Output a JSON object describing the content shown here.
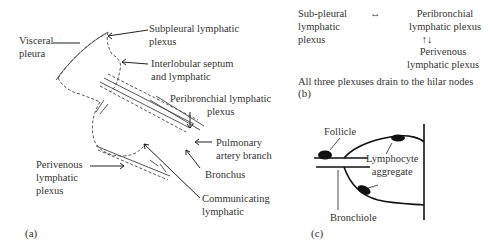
{
  "panel_a": {
    "tag": "(a)",
    "labels": {
      "visceral_pleura": [
        "Visceral",
        "pleura"
      ],
      "subpleural": [
        "Subpleural lymphatic",
        "plexus"
      ],
      "interlobular": [
        "Interlobular septum",
        "and lymphatic"
      ],
      "peribronchial": [
        "Peribronchial lymphatic",
        "plexus"
      ],
      "pulmonary_artery": [
        "Pulmonary",
        "artery branch"
      ],
      "bronchus": "Bronchus",
      "perivenous": [
        "Perivenous",
        "lymphatic",
        "plexus"
      ],
      "communicating": [
        "Communicating",
        "lymphatic"
      ]
    }
  },
  "panel_b": {
    "tag": "(b)",
    "subpleural": [
      "Sub-pleural",
      "lymphatic",
      "plexus"
    ],
    "horizontal_arrow": "↔",
    "peribronchial": [
      "Peribronchial",
      "lymphatic plexus"
    ],
    "vertical_arrow": "↑↓",
    "perivenous": [
      "Perivenous",
      "lymphatic plexus"
    ],
    "summary": "All three plexuses drain to the hilar nodes"
  },
  "panel_c": {
    "tag": "(c)",
    "follicle": "Follicle",
    "lymphocyte_aggregate": [
      "Lymphocyte",
      "aggregate"
    ],
    "bronchiole": "Bronchiole"
  }
}
